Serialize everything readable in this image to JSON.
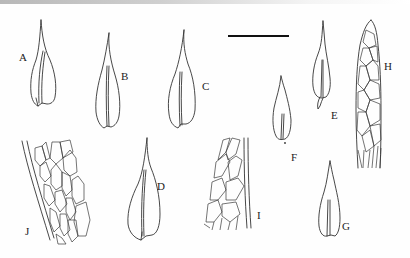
{
  "figure": {
    "panels": [
      {
        "id": "A",
        "label": "A",
        "type": "leaf"
      },
      {
        "id": "B",
        "label": "B",
        "type": "leaf"
      },
      {
        "id": "C",
        "label": "C",
        "type": "leaf"
      },
      {
        "id": "D",
        "label": "D",
        "type": "leaf"
      },
      {
        "id": "E",
        "label": "E",
        "type": "leaf"
      },
      {
        "id": "F",
        "label": "F",
        "type": "leaf"
      },
      {
        "id": "G",
        "label": "G",
        "type": "leaf"
      },
      {
        "id": "H",
        "label": "H",
        "type": "leaf-apex-cells"
      },
      {
        "id": "I",
        "label": "I",
        "type": "leaf-mid-cells"
      },
      {
        "id": "J",
        "label": "J",
        "type": "leaf-base-cells"
      }
    ],
    "scale_bar": {
      "label": ""
    }
  }
}
